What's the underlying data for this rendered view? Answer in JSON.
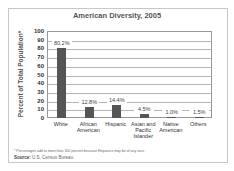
{
  "chart_data": {
    "type": "bar",
    "title": "American Diversity, 2005",
    "xlabel": "",
    "ylabel": "Percent of Total Population*",
    "ylim": [
      0,
      100
    ],
    "yticks": [
      0,
      10,
      20,
      30,
      40,
      50,
      60,
      70,
      80,
      90,
      100
    ],
    "grid": true,
    "categories": [
      "White",
      "African American",
      "Hispanic",
      "Asian and Pacific Islander",
      "Native American",
      "Others"
    ],
    "values": [
      80.2,
      12.8,
      14.4,
      4.5,
      1.0,
      1.5
    ],
    "value_labels": [
      "80.2%",
      "12.8%",
      "14.4%",
      "4.5%",
      "1.0%",
      "1.5%"
    ],
    "bar_color": "#555555"
  },
  "footnote": "* Percentages add to more than 100 percent because Hispanics may be of any race.",
  "source_label": "Source:",
  "source_text": "U.S. Census Bureau."
}
